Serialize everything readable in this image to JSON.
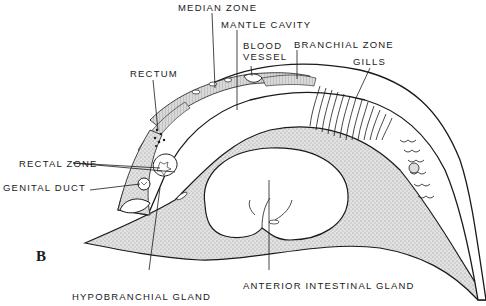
{
  "figure": {
    "panel_letter": "B",
    "colors": {
      "ink": "#1a1a1a",
      "stipple": "#cfcfcf",
      "stipple_dark": "#b5b5b5",
      "background": "#ffffff"
    }
  },
  "labels": {
    "median_zone": "MEDIAN ZONE",
    "mantle_cavity": "MANTLE CAVITY",
    "blood_vessel_1": "BLOOD",
    "blood_vessel_2": "VESSEL",
    "branchial_zone": "BRANCHIAL ZONE",
    "gills": "GILLS",
    "rectum": "RECTUM",
    "rectal_zone": "RECTAL ZONE",
    "genital_duct": "GENITAL DUCT",
    "hypobranchial_gland": "HYPOBRANCHIAL GLAND",
    "anterior_intestinal_gland": "ANTERIOR INTESTINAL GLAND"
  }
}
